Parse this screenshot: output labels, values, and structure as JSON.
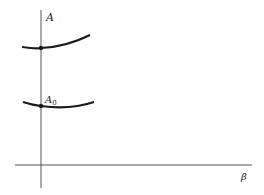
{
  "diagram": {
    "axes": {
      "y_label": "A",
      "x_label": "β"
    },
    "curves": [
      {
        "name": "upper-curve",
        "marked_point": true
      },
      {
        "name": "lower-curve",
        "marked_point": true,
        "label": "A",
        "label_subscript": "0"
      }
    ],
    "colors": {
      "ink": "#1a1a1a",
      "axis": "#555555",
      "background": "#ffffff"
    }
  }
}
